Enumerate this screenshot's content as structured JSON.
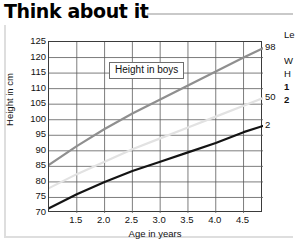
{
  "header": {
    "title": "Think about it"
  },
  "legend": {
    "box_label": "Height in boys"
  },
  "side_note": {
    "lines": [
      "Le",
      "",
      "W",
      "H",
      "1",
      "2"
    ],
    "bold_from_index": 4
  },
  "chart_data": {
    "type": "line",
    "title": "Height in boys",
    "xlabel": "Age in years",
    "ylabel": "Height in cm",
    "xlim": [
      1.0,
      4.85
    ],
    "ylim": [
      70,
      125
    ],
    "grid": true,
    "legend_position": "right",
    "xticks": [
      1.5,
      2.0,
      2.5,
      3.0,
      3.5,
      4.0,
      4.5
    ],
    "xtick_labels": [
      "1.5",
      "2.0",
      "2.5",
      "3.0",
      "3.5",
      "4.0",
      "4.5"
    ],
    "yticks": [
      70,
      75,
      80,
      85,
      90,
      95,
      100,
      105,
      110,
      115,
      120,
      125
    ],
    "ytick_labels": [
      "70",
      "75",
      "80",
      "85",
      "90",
      "95",
      "100",
      "105",
      "110",
      "115",
      "120",
      "125"
    ],
    "x": [
      1.0,
      1.5,
      2.0,
      2.5,
      3.0,
      3.5,
      4.0,
      4.5,
      4.85
    ],
    "series": [
      {
        "name": "98",
        "label": "98",
        "color": "#8f8f8f",
        "width": 2.2,
        "values": [
          85.5,
          91.5,
          97.0,
          102.0,
          106.5,
          111.0,
          115.5,
          120.0,
          123.0
        ]
      },
      {
        "name": "50",
        "label": "50",
        "color": "#e2e2e2",
        "width": 2.2,
        "values": [
          78.0,
          82.5,
          86.5,
          90.5,
          94.0,
          97.5,
          101.0,
          104.5,
          107.0
        ]
      },
      {
        "name": "2",
        "label": "2",
        "color": "#141414",
        "width": 2.2,
        "values": [
          71.5,
          76.0,
          80.0,
          83.5,
          86.5,
          89.5,
          92.5,
          96.0,
          98.0
        ]
      }
    ],
    "annotations": [
      {
        "text": "98",
        "x": 4.85,
        "y": 123.0
      },
      {
        "text": "50",
        "x": 4.85,
        "y": 107.0
      },
      {
        "text": "2",
        "x": 4.85,
        "y": 98.0
      }
    ]
  }
}
